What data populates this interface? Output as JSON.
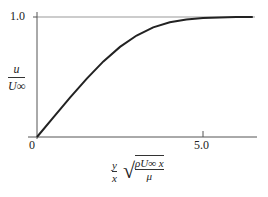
{
  "chart_data": {
    "type": "line",
    "title": "",
    "xlabel": "(y/x) √(ρU∞x/μ)",
    "ylabel": "u/U∞",
    "x": [
      0,
      0.5,
      1,
      1.5,
      2,
      2.5,
      3,
      3.5,
      4,
      4.5,
      5,
      5.5,
      6,
      6.5
    ],
    "series": [
      {
        "name": "Blasius profile",
        "values": [
          0,
          0.166,
          0.33,
          0.487,
          0.63,
          0.751,
          0.846,
          0.913,
          0.956,
          0.98,
          0.992,
          0.997,
          0.999,
          1.0
        ]
      }
    ],
    "xticks": [
      "0",
      "5.0"
    ],
    "yticks": [
      "0",
      "1.0"
    ],
    "xlim": [
      0,
      6.6
    ],
    "ylim": [
      0,
      1.0
    ],
    "grid": false,
    "legend": "none"
  },
  "labels": {
    "y_one": "1.0",
    "x_zero": "0",
    "x_five": "5.0",
    "y_num": "u",
    "y_den": "U∞",
    "x_frac_num": "y",
    "x_frac_den": "x",
    "sqrt_num": "ρU∞ x",
    "sqrt_den": "μ"
  }
}
